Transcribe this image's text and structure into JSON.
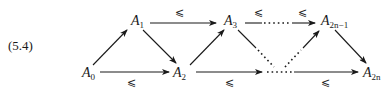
{
  "equation_number": "(5.4)",
  "nodes": [
    {
      "id": "A0",
      "base": "A",
      "sub": "0",
      "x": 82,
      "y": 68
    },
    {
      "id": "A1",
      "base": "A",
      "sub": "1",
      "x": 131,
      "y": 16
    },
    {
      "id": "A2",
      "base": "A",
      "sub": "2",
      "x": 173,
      "y": 68
    },
    {
      "id": "A3",
      "base": "A",
      "sub": "3",
      "x": 225,
      "y": 16
    },
    {
      "id": "A2n-1",
      "base": "A",
      "sub": "2n−1",
      "x": 322,
      "y": 16
    },
    {
      "id": "A2n",
      "base": "A",
      "sub": "2n",
      "x": 364,
      "y": 68
    }
  ],
  "relation_symbol": "⩽",
  "edges": [
    {
      "from": "A0",
      "to": "A1",
      "style": "solid",
      "label": ""
    },
    {
      "from": "A1",
      "to": "A2",
      "style": "solid",
      "label": ""
    },
    {
      "from": "A0",
      "to": "A2",
      "style": "solid",
      "label": "⩽",
      "label_pos": "below"
    },
    {
      "from": "A1",
      "to": "A3",
      "style": "solid",
      "label": "⩽",
      "label_pos": "above"
    },
    {
      "from": "A2",
      "to": "A3",
      "style": "solid",
      "label": ""
    },
    {
      "from": "A3",
      "to": "A2n-1",
      "style": "dotted-middle",
      "label": "⩽ ⩽",
      "label_pos": "above"
    },
    {
      "from": "A3",
      "to": "bottom-dots",
      "style": "solid-then-dotted",
      "label": ""
    },
    {
      "from": "bottom-dots",
      "to": "A2n-1",
      "style": "dotted-then-solid",
      "label": ""
    },
    {
      "from": "A2",
      "to": "A2n",
      "style": "dotted-middle",
      "label": "⩽ ⩽",
      "label_pos": "below"
    },
    {
      "from": "A2n-1",
      "to": "A2n",
      "style": "solid",
      "label": ""
    }
  ],
  "colors": {
    "ink": "#1a1a1a",
    "background": "#ffffff"
  }
}
